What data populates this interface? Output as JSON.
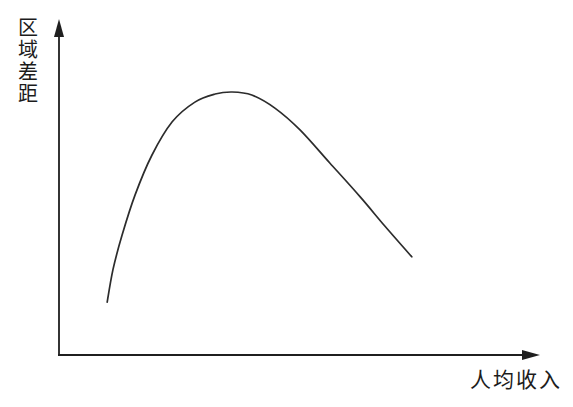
{
  "chart": {
    "ylabel": "区域差距",
    "xlabel": "人均收入",
    "axis_color": "#1f1f1f",
    "curve_color": "#2c2c2c",
    "background": "#ffffff"
  },
  "chart_data": {
    "type": "line",
    "title": "",
    "xlabel": "人均收入",
    "ylabel": "区域差距",
    "x_axis": {
      "range": [
        0,
        1
      ],
      "ticks": [],
      "arrow": true
    },
    "y_axis": {
      "range": [
        0,
        1
      ],
      "ticks": [],
      "arrow": true
    },
    "grid": false,
    "legend": "none",
    "series": [
      {
        "name": "inverted-u-curve",
        "description": "区域差距 rises then falls as 人均收入 increases (inverted-U / Kuznets curve)",
        "points": [
          [
            0.102,
            0.158
          ],
          [
            0.114,
            0.254
          ],
          [
            0.133,
            0.358
          ],
          [
            0.16,
            0.478
          ],
          [
            0.195,
            0.597
          ],
          [
            0.237,
            0.696
          ],
          [
            0.284,
            0.755
          ],
          [
            0.326,
            0.779
          ],
          [
            0.361,
            0.785
          ],
          [
            0.402,
            0.776
          ],
          [
            0.45,
            0.737
          ],
          [
            0.502,
            0.672
          ],
          [
            0.564,
            0.573
          ],
          [
            0.627,
            0.472
          ],
          [
            0.678,
            0.385
          ],
          [
            0.734,
            0.293
          ]
        ]
      }
    ]
  }
}
